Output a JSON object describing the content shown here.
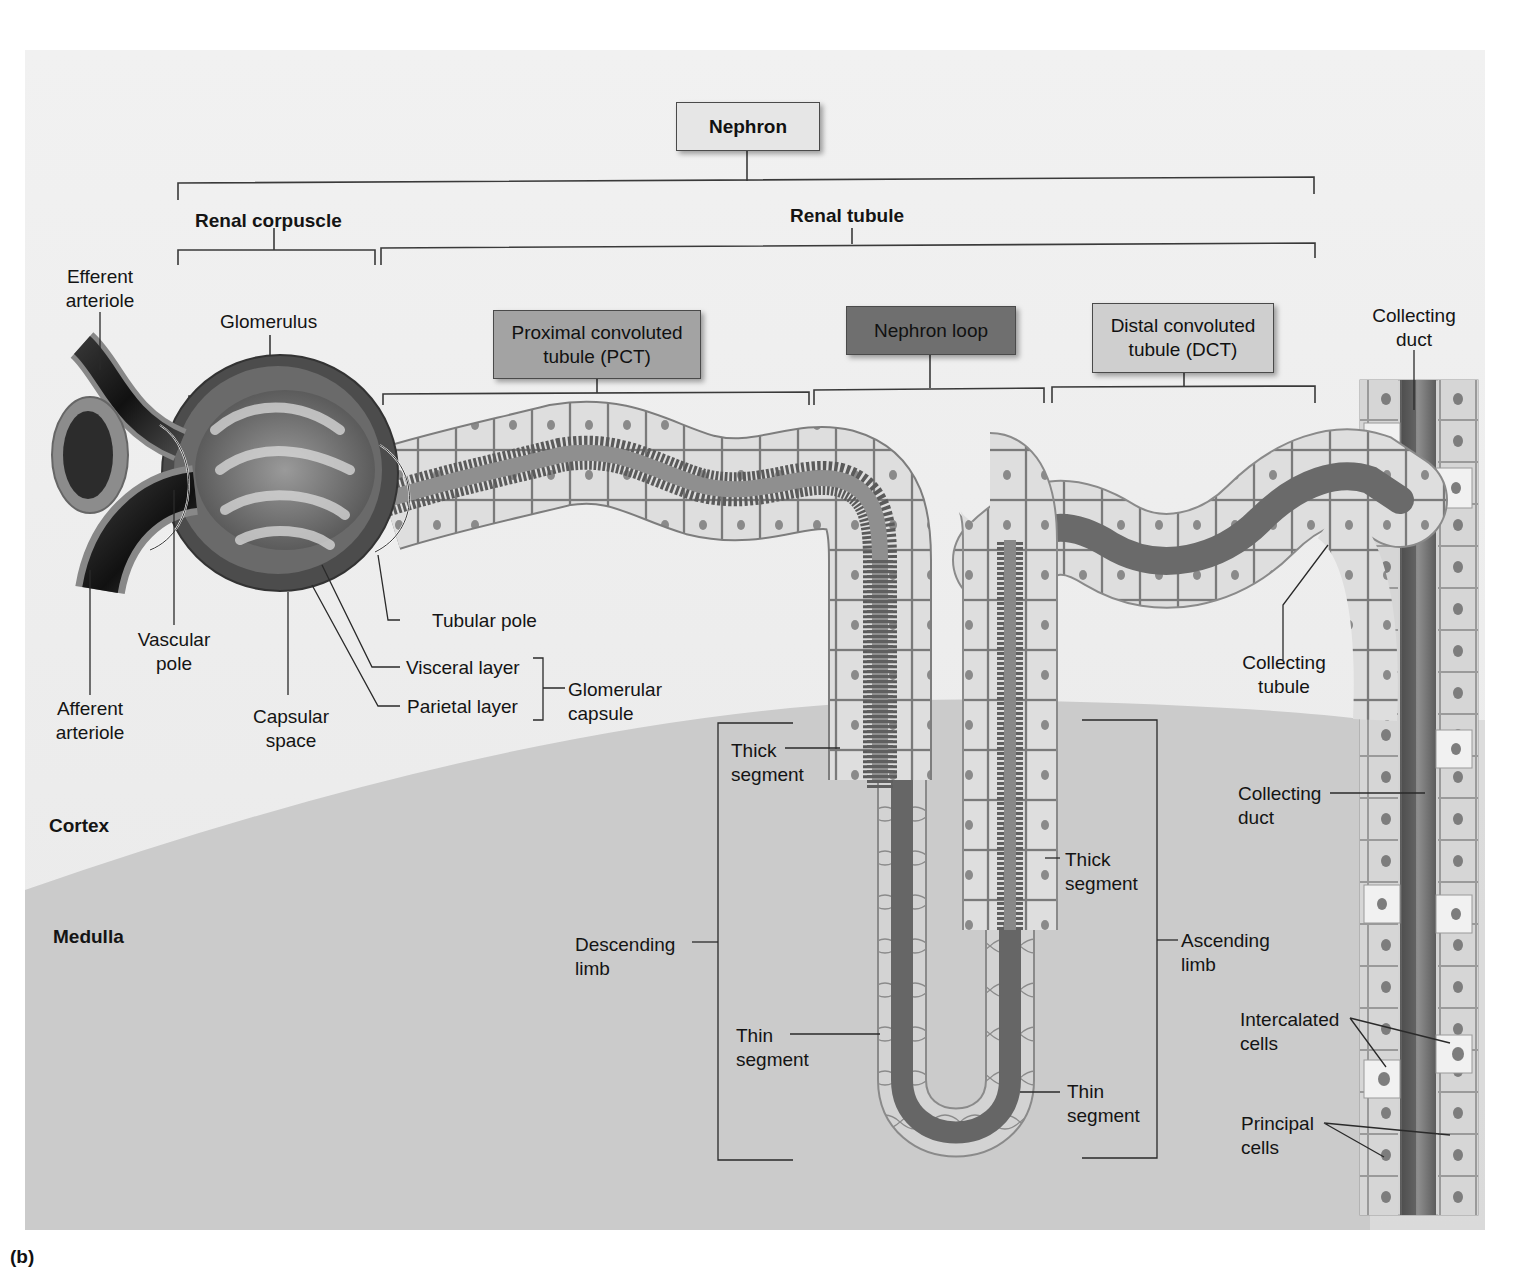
{
  "figure": {
    "panel_letter": "(b)",
    "colors": {
      "background": "#ffffff",
      "cortex": "#ececec",
      "medulla": "#c9c9c9",
      "nephron_box": "#e6e6e6",
      "pct_box": "#a3a3a3",
      "loop_box": "#6f6f6f",
      "dct_box": "#cfcfcf",
      "tubule_cells": "#dcdcdc",
      "lumen": "#777777",
      "vessel_dark": "#1e1e1e"
    },
    "hierarchy": {
      "nephron": {
        "label": "Nephron"
      },
      "renal_corpuscle": {
        "label": "Renal corpuscle"
      },
      "renal_tubule": {
        "label": "Renal tubule"
      },
      "pct": {
        "line1": "Proximal convoluted",
        "line2": "tubule (PCT)"
      },
      "nephron_loop": {
        "label": "Nephron loop"
      },
      "dct": {
        "line1": "Distal convoluted",
        "line2": "tubule (DCT)"
      }
    },
    "labels": {
      "efferent_arteriole": {
        "line1": "Efferent",
        "line2": "arteriole"
      },
      "glomerulus": {
        "line1": "Glomerulus"
      },
      "collecting_duct_top": {
        "line1": "Collecting",
        "line2": "duct"
      },
      "vascular_pole": {
        "line1": "Vascular",
        "line2": "pole"
      },
      "afferent_arteriole": {
        "line1": "Afferent",
        "line2": "arteriole"
      },
      "capsular_space": {
        "line1": "Capsular",
        "line2": "space"
      },
      "tubular_pole": {
        "line1": "Tubular pole"
      },
      "visceral_layer": {
        "line1": "Visceral layer"
      },
      "parietal_layer": {
        "line1": "Parietal layer"
      },
      "glomerular_capsule": {
        "line1": "Glomerular",
        "line2": "capsule"
      },
      "collecting_tubule": {
        "line1": "Collecting",
        "line2": "tubule"
      },
      "thick_segment_desc": {
        "line1": "Thick",
        "line2": "segment"
      },
      "thin_segment_desc": {
        "line1": "Thin",
        "line2": "segment"
      },
      "descending_limb": {
        "line1": "Descending",
        "line2": "limb"
      },
      "thick_segment_asc": {
        "line1": "Thick",
        "line2": "segment"
      },
      "thin_segment_asc": {
        "line1": "Thin",
        "line2": "segment"
      },
      "ascending_limb": {
        "line1": "Ascending",
        "line2": "limb"
      },
      "collecting_duct_mid": {
        "line1": "Collecting",
        "line2": "duct"
      },
      "intercalated_cells": {
        "line1": "Intercalated",
        "line2": "cells"
      },
      "principal_cells": {
        "line1": "Principal",
        "line2": "cells"
      }
    },
    "regions": {
      "cortex": "Cortex",
      "medulla": "Medulla"
    }
  }
}
